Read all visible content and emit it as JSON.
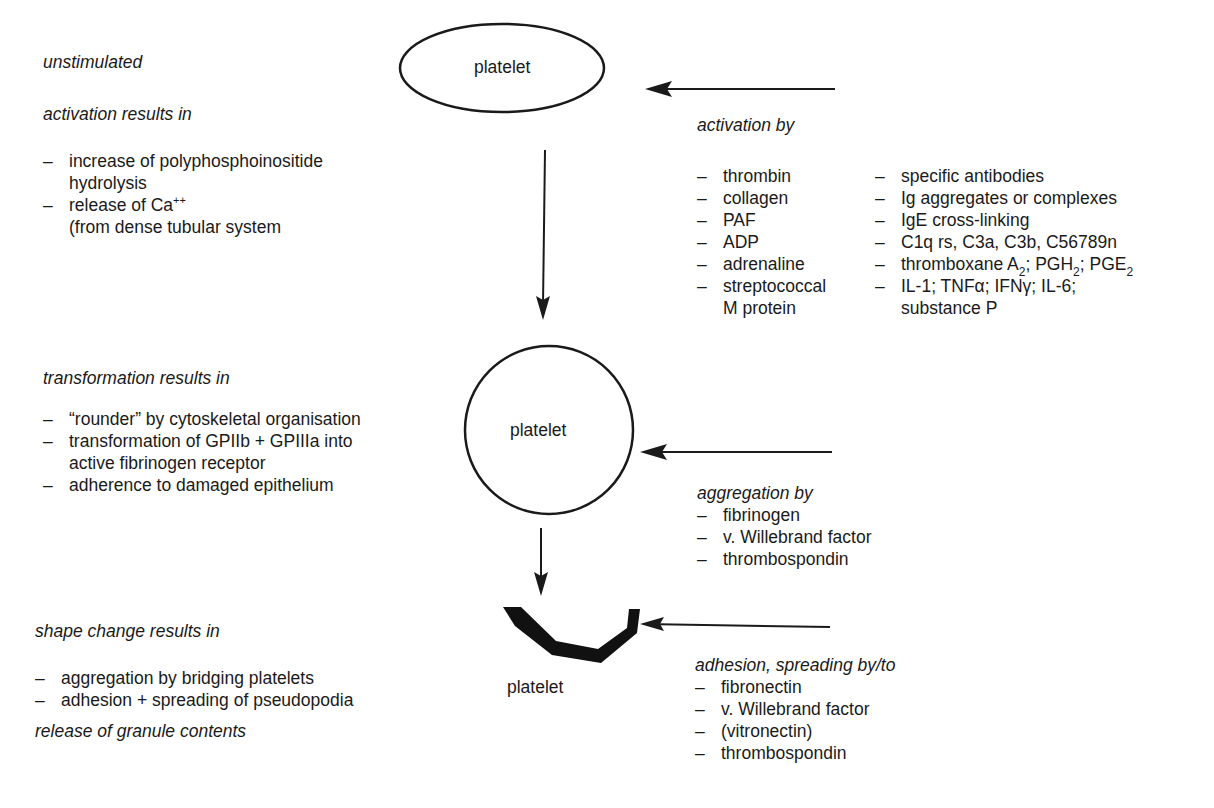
{
  "left": {
    "unstimulated": "unstimulated",
    "activation": {
      "heading": "activation results in",
      "items": [
        {
          "dash": "–",
          "line1": "increase of polyphosphoinositide",
          "line2": "hydrolysis"
        },
        {
          "dash": "–",
          "line1_text": "release of Ca",
          "line1_sup": "++",
          "line2": "(from dense tubular system"
        }
      ]
    },
    "transformation": {
      "heading": "transformation results in",
      "items": [
        {
          "dash": "–",
          "line1": "“rounder” by cytoskeletal organisation"
        },
        {
          "dash": "–",
          "line1": "transformation of GPIIb + GPIIIa into",
          "line2": "active fibrinogen receptor"
        },
        {
          "dash": "–",
          "line1": "adherence to damaged epithelium"
        }
      ]
    },
    "shape_change": {
      "heading": "shape change results in",
      "items": [
        {
          "dash": "–",
          "line1": "aggregation by bridging platelets"
        },
        {
          "dash": "–",
          "line1": "adhesion + spreading of pseudopodia"
        }
      ]
    },
    "release": "release of granule contents"
  },
  "nodes": {
    "unstimulated": "platelet",
    "transformed": "platelet",
    "shape_changed": "platelet"
  },
  "right": {
    "activation": {
      "heading": "activation by",
      "col1": [
        {
          "dash": "–",
          "text": "thrombin"
        },
        {
          "dash": "–",
          "text": "collagen"
        },
        {
          "dash": "–",
          "text": "PAF"
        },
        {
          "dash": "–",
          "text": "ADP"
        },
        {
          "dash": "–",
          "text": "adrenaline"
        },
        {
          "dash": "–",
          "text": "streptococcal",
          "line2": "M protein"
        }
      ],
      "col2": [
        {
          "dash": "–",
          "text": "specific antibodies"
        },
        {
          "dash": "–",
          "text": "Ig aggregates or complexes"
        },
        {
          "dash": "–",
          "text": "IgE cross-linking"
        },
        {
          "dash": "–",
          "text": "C1q rs, C3a, C3b, C56789n"
        },
        {
          "dash": "–",
          "parts": [
            "thromboxane A",
            "2",
            "; PGH",
            "2",
            "; PGE",
            "2"
          ]
        },
        {
          "dash": "–",
          "text": "IL-1; TNFα; IFNγ; IL-6;",
          "line2": "substance P"
        }
      ]
    },
    "aggregation": {
      "heading": "aggregation by",
      "items": [
        {
          "dash": "–",
          "text": "fibrinogen"
        },
        {
          "dash": "–",
          "text": "v. Willebrand factor"
        },
        {
          "dash": "–",
          "text": "thrombospondin"
        }
      ]
    },
    "adhesion": {
      "heading": "adhesion, spreading by/to",
      "items": [
        {
          "dash": "–",
          "text": "fibronectin"
        },
        {
          "dash": "–",
          "text": "v. Willebrand factor"
        },
        {
          "dash": "–",
          "text": "(vitronectin)"
        },
        {
          "dash": "–",
          "text": "thrombospondin"
        }
      ]
    }
  },
  "colors": {
    "ink": "#1a1a1a",
    "background": "#ffffff"
  }
}
